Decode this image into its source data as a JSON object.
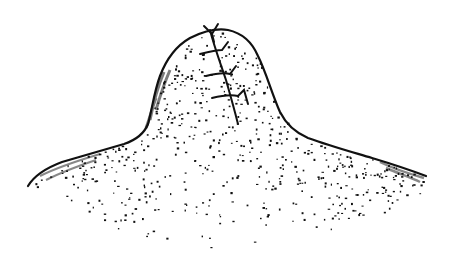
{
  "image": {
    "title": "Stippled ink illustration of a sutured mound",
    "description": "Pen-and-ink stipple drawing of a domed mound with a broad flared base; a vertical line of stitches (sutures) runs down the upper dome.",
    "colors": {
      "ink": "#111111",
      "background": "#ffffff"
    },
    "elements": {
      "outline": "mound-outline",
      "stitches_count": 4,
      "stipple": "dot-shading"
    }
  }
}
